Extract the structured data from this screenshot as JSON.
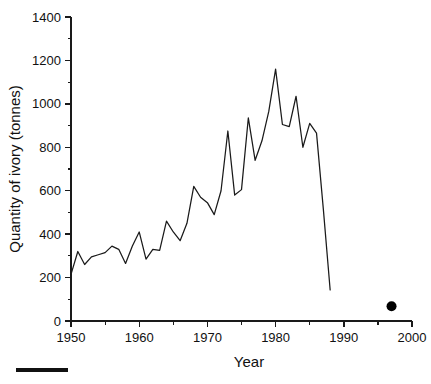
{
  "chart_data": {
    "type": "line",
    "title": "",
    "xlabel": "Year",
    "ylabel": "Quantity of ivory (tonnes)",
    "xlim": [
      1950,
      2000
    ],
    "ylim": [
      0,
      1400
    ],
    "xticks": [
      1950,
      1960,
      1970,
      1980,
      1990,
      2000
    ],
    "xtick_labels": [
      "1950",
      "1960",
      "1970",
      "1980",
      "1990",
      "2000"
    ],
    "xminor_interval": 5,
    "yticks": [
      0,
      200,
      400,
      600,
      800,
      1000,
      1200,
      1400
    ],
    "ytick_labels": [
      "0",
      "200",
      "400",
      "600",
      "800",
      "1000",
      "1200",
      "1400"
    ],
    "yminor_interval": 100,
    "grid": false,
    "legend": null,
    "line_color": "#1a1a1a",
    "marker_color": "#000000",
    "series": [
      {
        "name": "Ivory exports",
        "kind": "line",
        "x": [
          1950,
          1951,
          1952,
          1953,
          1954,
          1955,
          1956,
          1957,
          1958,
          1959,
          1960,
          1961,
          1962,
          1963,
          1964,
          1965,
          1966,
          1967,
          1968,
          1969,
          1970,
          1971,
          1972,
          1973,
          1974,
          1975,
          1976,
          1977,
          1978,
          1979,
          1980,
          1981,
          1982,
          1983,
          1984,
          1985,
          1986,
          1987,
          1988
        ],
        "y": [
          215,
          320,
          260,
          295,
          305,
          315,
          345,
          330,
          265,
          345,
          410,
          285,
          330,
          325,
          460,
          410,
          370,
          450,
          620,
          570,
          545,
          490,
          600,
          875,
          580,
          605,
          935,
          740,
          830,
          965,
          1160,
          905,
          895,
          1035,
          800,
          910,
          865,
          515,
          143
        ]
      },
      {
        "name": "Post-ban export point",
        "kind": "scatter",
        "x": [
          1997
        ],
        "y": [
          68
        ]
      }
    ]
  },
  "figure": {
    "scale_bar": {
      "label": "",
      "visible": true
    }
  }
}
